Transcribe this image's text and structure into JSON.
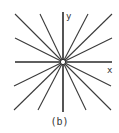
{
  "figure": {
    "caption": "(b)",
    "x_axis_label": "x",
    "y_axis_label": "y",
    "center": [
      63,
      62
    ],
    "line_color": "#3a3a3a",
    "x_axis": {
      "x1": 15,
      "y1": 62,
      "x2": 112,
      "y2": 62
    },
    "y_axis": {
      "x1": 63,
      "y1": 12,
      "x2": 63,
      "y2": 112
    },
    "rays": [
      {
        "x1": 15,
        "y1": 14,
        "x2": 111,
        "y2": 110
      },
      {
        "x1": 40,
        "y1": 14,
        "x2": 86,
        "y2": 110
      },
      {
        "x1": 88,
        "y1": 14,
        "x2": 38,
        "y2": 110
      },
      {
        "x1": 112,
        "y1": 14,
        "x2": 14,
        "y2": 110
      },
      {
        "x1": 15,
        "y1": 38,
        "x2": 111,
        "y2": 86
      },
      {
        "x1": 112,
        "y1": 38,
        "x2": 14,
        "y2": 86
      }
    ]
  }
}
